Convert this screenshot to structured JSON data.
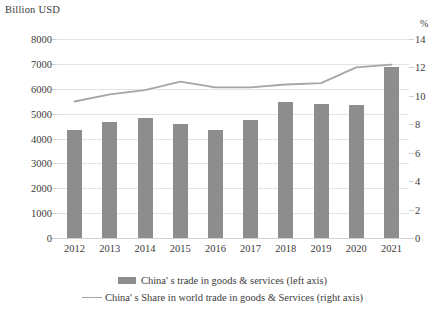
{
  "chart_data": {
    "type": "bar",
    "title": "",
    "categories": [
      "2012",
      "2013",
      "2014",
      "2015",
      "2016",
      "2017",
      "2018",
      "2019",
      "2020",
      "2021"
    ],
    "xlabel": "",
    "ylabel": "Billion USD",
    "ylabel_right": "%",
    "ylim": [
      0,
      8000
    ],
    "ylim_right": [
      0,
      14
    ],
    "yticks": [
      8000,
      7000,
      6000,
      5000,
      4000,
      3000,
      2000,
      1000,
      0
    ],
    "yticks_right": [
      14,
      12,
      10,
      8,
      6,
      4,
      2,
      0
    ],
    "grid": true,
    "legend_position": "bottom",
    "series": [
      {
        "name": "China' s trade in goods & services (left axis)",
        "type": "bar",
        "axis": "left",
        "color": "#8d8d8d",
        "values": [
          4350,
          4650,
          4820,
          4600,
          4350,
          4760,
          5460,
          5400,
          5350,
          6880
        ]
      },
      {
        "name": "China' s Share in world trade in goods & Services (right axis)",
        "type": "line",
        "axis": "right",
        "color": "#a6a6a6",
        "values": [
          9.6,
          10.1,
          10.4,
          11.0,
          10.6,
          10.6,
          10.8,
          10.9,
          12.0,
          12.2
        ]
      }
    ]
  },
  "axes": {
    "left_title": "Billion USD",
    "right_title": "%"
  },
  "legend": {
    "items": [
      {
        "label": "China' s trade in goods & services (left axis)",
        "marker": "bar-swatch"
      },
      {
        "label": "China' s Share in world trade in goods & Services (right axis)",
        "marker": "line-swatch"
      }
    ]
  }
}
